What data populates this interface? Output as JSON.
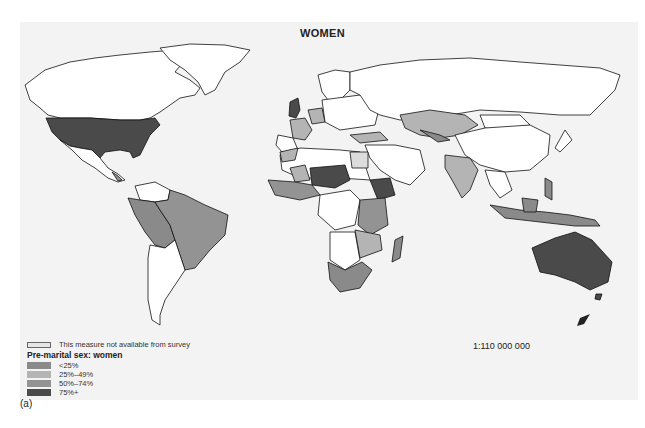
{
  "map": {
    "title": "WOMEN",
    "scale": "1:110 000 000",
    "panel_label": "(a)"
  },
  "legend": {
    "not_available": "This measure not available from survey",
    "heading": "Pre-marital sex: women",
    "classes": [
      {
        "label": "<25%",
        "color": "#8a8a8a"
      },
      {
        "label": "25%–49%",
        "color": "#b4b4b4"
      },
      {
        "label": "50%–74%",
        "color": "#939393"
      },
      {
        "label": "75%+",
        "color": "#4a4a4a"
      }
    ],
    "na_color": "#e6e6e6"
  },
  "colors": {
    "land_default": "#ffffff",
    "border": "#111111",
    "c_lt25": "#8a8a8a",
    "c_25_49": "#b4b4b4",
    "c_50_74": "#939393",
    "c_75plus": "#4a4a4a",
    "na": "#dcdcdc"
  },
  "regions": [
    {
      "name": "United States",
      "class": "75%+"
    },
    {
      "name": "Australia",
      "class": "75%+"
    },
    {
      "name": "New Zealand",
      "class": "75%+"
    },
    {
      "name": "United Kingdom",
      "class": "75%+"
    },
    {
      "name": "Niger/Chad region",
      "class": "75%+"
    },
    {
      "name": "Ethiopia",
      "class": "75%+"
    },
    {
      "name": "Brazil",
      "class": "50%–74%"
    },
    {
      "name": "Peru/Bolivia/Colombia",
      "class": "<25%"
    },
    {
      "name": "Southern Africa",
      "class": "<25%"
    },
    {
      "name": "Madagascar",
      "class": "<25%"
    },
    {
      "name": "Indonesia",
      "class": "<25%"
    },
    {
      "name": "Philippines",
      "class": "<25%"
    },
    {
      "name": "Kazakhstan",
      "class": "25%–49%"
    },
    {
      "name": "India",
      "class": "25%–49%"
    },
    {
      "name": "France",
      "class": "25%–49%"
    },
    {
      "name": "Germany",
      "class": "25%–49%"
    },
    {
      "name": "Turkey",
      "class": "25%–49%"
    },
    {
      "name": "Egypt",
      "class": "This measure not available from survey"
    },
    {
      "name": "Morocco",
      "class": "25%–49%"
    },
    {
      "name": "Mali",
      "class": "25%–49%"
    }
  ]
}
